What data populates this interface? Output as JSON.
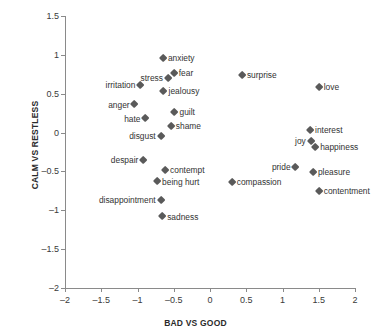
{
  "chart_data": {
    "type": "scatter",
    "title": "",
    "xlabel": "BAD VS GOOD",
    "ylabel": "CALM VS RESTLESS",
    "xlim": [
      -2,
      2
    ],
    "ylim": [
      -2,
      1.5
    ],
    "xticks": [
      "-2",
      "-1.5",
      "-1",
      "-0.5",
      "0",
      "0.5",
      "1",
      "1.5",
      "2"
    ],
    "xtick_values": [
      -2,
      -1.5,
      -1,
      -0.5,
      0,
      0.5,
      1,
      1.5,
      2
    ],
    "yticks": [
      "1.5",
      "1",
      "0.5",
      "0",
      "-0.5",
      "-1",
      "-1.5",
      "-2"
    ],
    "ytick_values": [
      1.5,
      1,
      0.5,
      0,
      -0.5,
      -1,
      -1.5,
      -2
    ],
    "grid": false,
    "legend": "none",
    "marker_shape": "diamond",
    "marker_color": "#5a5a5a",
    "points": [
      {
        "label": "anxiety",
        "x": -0.65,
        "y": 0.96,
        "label_side": "right"
      },
      {
        "label": "fear",
        "x": -0.5,
        "y": 0.77,
        "label_side": "right"
      },
      {
        "label": "stress",
        "x": -0.58,
        "y": 0.7,
        "label_side": "left"
      },
      {
        "label": "irritation",
        "x": -0.96,
        "y": 0.61,
        "label_side": "left"
      },
      {
        "label": "jealousy",
        "x": -0.64,
        "y": 0.53,
        "label_side": "right"
      },
      {
        "label": "anger",
        "x": -1.04,
        "y": 0.36,
        "label_side": "left"
      },
      {
        "label": "guilt",
        "x": -0.49,
        "y": 0.26,
        "label_side": "right"
      },
      {
        "label": "hate",
        "x": -0.89,
        "y": 0.18,
        "label_side": "left"
      },
      {
        "label": "shame",
        "x": -0.54,
        "y": 0.08,
        "label_side": "right"
      },
      {
        "label": "disgust",
        "x": -0.68,
        "y": -0.05,
        "label_side": "left"
      },
      {
        "label": "despair",
        "x": -0.92,
        "y": -0.35,
        "label_side": "left"
      },
      {
        "label": "contempt",
        "x": -0.62,
        "y": -0.48,
        "label_side": "right"
      },
      {
        "label": "being hurt",
        "x": -0.73,
        "y": -0.63,
        "label_side": "right"
      },
      {
        "label": "disappointment",
        "x": -0.68,
        "y": -0.87,
        "label_side": "left"
      },
      {
        "label": "sadness",
        "x": -0.66,
        "y": -1.08,
        "label_side": "right"
      },
      {
        "label": "surprise",
        "x": 0.44,
        "y": 0.74,
        "label_side": "right"
      },
      {
        "label": "compassion",
        "x": 0.3,
        "y": -0.64,
        "label_side": "right"
      },
      {
        "label": "love",
        "x": 1.5,
        "y": 0.58,
        "label_side": "right"
      },
      {
        "label": "interest",
        "x": 1.38,
        "y": 0.03,
        "label_side": "right"
      },
      {
        "label": "joy",
        "x": 1.39,
        "y": -0.11,
        "label_side": "left"
      },
      {
        "label": "happiness",
        "x": 1.45,
        "y": -0.19,
        "label_side": "right"
      },
      {
        "label": "pride",
        "x": 1.18,
        "y": -0.44,
        "label_side": "left"
      },
      {
        "label": "pleasure",
        "x": 1.42,
        "y": -0.51,
        "label_side": "right"
      },
      {
        "label": "contentment",
        "x": 1.5,
        "y": -0.75,
        "label_side": "right"
      }
    ]
  }
}
